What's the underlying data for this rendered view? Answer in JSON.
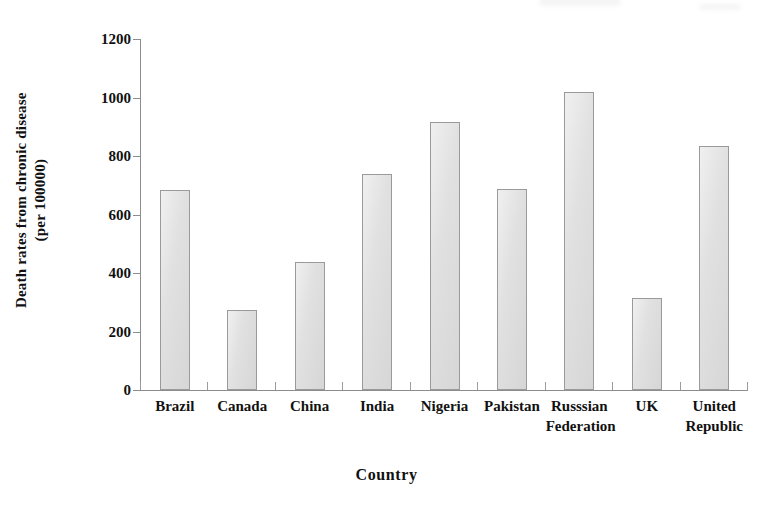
{
  "chart_data": {
    "type": "bar",
    "title": "",
    "xlabel": "Country",
    "ylabel": "Death rates from chronic disease (per 100000)",
    "ylabel_line1": "Death rates from chronic disease",
    "ylabel_line2": "(per 100000)",
    "categories": [
      "Brazil",
      "Canada",
      "China",
      "India",
      "Nigeria",
      "Pakistan",
      "Russsian Federation",
      "UK",
      "United Republic"
    ],
    "category_lines": [
      [
        "Brazil"
      ],
      [
        "Canada"
      ],
      [
        "China"
      ],
      [
        "India"
      ],
      [
        "Nigeria"
      ],
      [
        "Pakistan"
      ],
      [
        "Russsian",
        "Federation"
      ],
      [
        "UK"
      ],
      [
        "United",
        "Republic"
      ]
    ],
    "values": [
      685,
      272,
      438,
      740,
      915,
      688,
      1018,
      315,
      835
    ],
    "ylim": [
      0,
      1200
    ],
    "yticks": [
      0,
      200,
      400,
      600,
      800,
      1000,
      1200
    ],
    "ytick_labels": [
      "0",
      "200",
      "400",
      "600",
      "800",
      "1000",
      "1200"
    ],
    "grid": false,
    "legend": false,
    "bar_fill": "#dedede",
    "bar_border": "#9a9a9a",
    "axis_color": "#8d8d8d",
    "text_color": "#111111"
  }
}
